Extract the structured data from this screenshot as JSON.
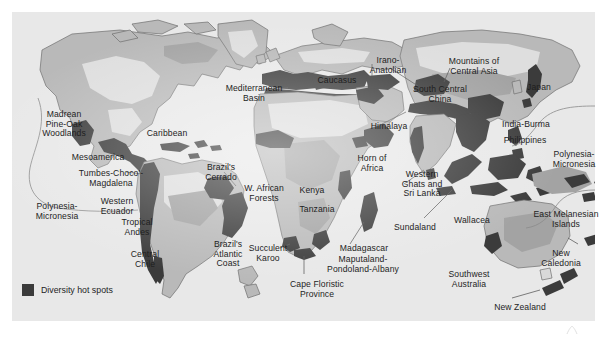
{
  "figure": {
    "kind": "world-map",
    "title_visible": false
  },
  "legend": {
    "label": "Diversity hot spots",
    "swatch_color": "#3b3b3b"
  },
  "palette": {
    "page_background": "#ffffff",
    "ocean": "#e8e8e8",
    "land_light": "#d9d9d9",
    "land_mid": "#b9b9b9",
    "land_dark": "#9e9e9e",
    "hotspot": "#3b3b3b",
    "coastline": "#6f6f6f",
    "text": "#1e1e1e",
    "leader_line": "#555555"
  },
  "hotspot_labels": [
    {
      "id": "madrean-pine-oak-woodlands",
      "text": "Madrean\nPine-Oak\nWoodlands",
      "x": 52,
      "y": 98,
      "align": "c"
    },
    {
      "id": "mesoamerica",
      "text": "Mesoamerica",
      "x": 86,
      "y": 141,
      "align": "c"
    },
    {
      "id": "caribbean",
      "text": "Caribbean",
      "x": 155,
      "y": 117,
      "align": "c"
    },
    {
      "id": "tumbes-choco-magdalena",
      "text": "Tumbes-Choco'-\nMagdalena",
      "x": 99,
      "y": 157,
      "align": "c"
    },
    {
      "id": "western-ecuador",
      "text": "Western\nEcuador",
      "x": 105,
      "y": 185,
      "align": "c"
    },
    {
      "id": "tropical-andes",
      "text": "Tropical\nAndes",
      "x": 125,
      "y": 206,
      "align": "c"
    },
    {
      "id": "central-chile",
      "text": "Central\nChile",
      "x": 133,
      "y": 238,
      "align": "c"
    },
    {
      "id": "polynesia-micronesia-west",
      "text": "Polynesia-\nMicronesia",
      "x": 45,
      "y": 190,
      "align": "c"
    },
    {
      "id": "brazils-cerrado",
      "text": "Brazil's\nCerrado",
      "x": 209,
      "y": 151,
      "align": "c"
    },
    {
      "id": "brazils-atlantic-coast",
      "text": "Brazil's\nAtlantic\nCoast",
      "x": 216,
      "y": 228,
      "align": "c"
    },
    {
      "id": "mediterranean-basin",
      "text": "Mediterranean\nBasin",
      "x": 242,
      "y": 72,
      "align": "c"
    },
    {
      "id": "caucasus",
      "text": "Caucasus",
      "x": 325,
      "y": 64,
      "align": "c"
    },
    {
      "id": "irano-anatolian",
      "text": "Irano-\nAnatolian",
      "x": 376,
      "y": 44,
      "align": "c"
    },
    {
      "id": "mountains-of-central-asia",
      "text": "Mountains of\nCentral Asia",
      "x": 462,
      "y": 45,
      "align": "c"
    },
    {
      "id": "south-central-china",
      "text": "South Central\nChina",
      "x": 428,
      "y": 73,
      "align": "c"
    },
    {
      "id": "japan",
      "text": "Japan",
      "x": 527,
      "y": 71,
      "align": "c"
    },
    {
      "id": "himalaya",
      "text": "Himalaya",
      "x": 377,
      "y": 110,
      "align": "c"
    },
    {
      "id": "india-burma",
      "text": "India-Burma",
      "x": 514,
      "y": 108,
      "align": "c"
    },
    {
      "id": "philippines",
      "text": "Philippines",
      "x": 513,
      "y": 124,
      "align": "c"
    },
    {
      "id": "w-african-forests",
      "text": "W. African\nForests",
      "x": 252,
      "y": 172,
      "align": "c"
    },
    {
      "id": "horn-of-africa",
      "text": "Horn of\nAfrica",
      "x": 360,
      "y": 142,
      "align": "c"
    },
    {
      "id": "kenya",
      "text": "Kenya",
      "x": 300,
      "y": 174,
      "align": "c"
    },
    {
      "id": "tanzania",
      "text": "Tanzania",
      "x": 305,
      "y": 193,
      "align": "c"
    },
    {
      "id": "succulent-karoo",
      "text": "Succulent\nKaroo",
      "x": 256,
      "y": 232,
      "align": "c"
    },
    {
      "id": "cape-floristic-province",
      "text": "Cape Floristic\nProvince",
      "x": 305,
      "y": 268,
      "align": "c"
    },
    {
      "id": "madagascar",
      "text": "Madagascar",
      "x": 352,
      "y": 232,
      "align": "c"
    },
    {
      "id": "maputaland-pondoland-albany",
      "text": "Maputaland-\nPondoland-Albany",
      "x": 351,
      "y": 243,
      "align": "c"
    },
    {
      "id": "western-ghats-and-sri-lanka",
      "text": "Western\nGhats and\nSri Lanka",
      "x": 410,
      "y": 158,
      "align": "c"
    },
    {
      "id": "sundaland",
      "text": "Sundaland",
      "x": 403,
      "y": 211,
      "align": "c"
    },
    {
      "id": "wallacea",
      "text": "Wallacea",
      "x": 460,
      "y": 204,
      "align": "c"
    },
    {
      "id": "east-melanesian-islands",
      "text": "East Melanesian\nIslands",
      "x": 554,
      "y": 198,
      "align": "c"
    },
    {
      "id": "polynesia-micronesia-east",
      "text": "Polynesia-\nMicronesia",
      "x": 562,
      "y": 138,
      "align": "c"
    },
    {
      "id": "new-caledonia",
      "text": "New\nCaledonia",
      "x": 549,
      "y": 237,
      "align": "c"
    },
    {
      "id": "southwest-australia",
      "text": "Southwest\nAustralia",
      "x": 457,
      "y": 258,
      "align": "c"
    },
    {
      "id": "new-zealand",
      "text": "New Zealand",
      "x": 508,
      "y": 291,
      "align": "c"
    }
  ]
}
